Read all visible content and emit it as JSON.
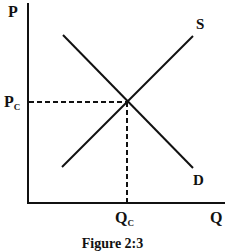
{
  "diagram": {
    "caption": "Figure 2:3",
    "axes": {
      "y_label": "P",
      "x_label": "Q"
    },
    "curves": {
      "supply_label": "S",
      "demand_label": "D"
    },
    "equilibrium": {
      "price_label": "P",
      "price_sub": "C",
      "quantity_label": "Q",
      "quantity_sub": "C"
    },
    "colors": {
      "line": "#111111",
      "background": "#ffffff"
    }
  }
}
